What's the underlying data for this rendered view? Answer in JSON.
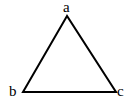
{
  "diagram": {
    "type": "triangle",
    "vertices": [
      {
        "id": "a",
        "label": "a",
        "x": 67,
        "y": 16
      },
      {
        "id": "b",
        "label": "b",
        "x": 23,
        "y": 92
      },
      {
        "id": "c",
        "label": "c",
        "x": 116,
        "y": 92
      }
    ],
    "edges": [
      [
        "a",
        "b"
      ],
      [
        "b",
        "c"
      ],
      [
        "c",
        "a"
      ]
    ],
    "stroke_color": "#000000"
  }
}
